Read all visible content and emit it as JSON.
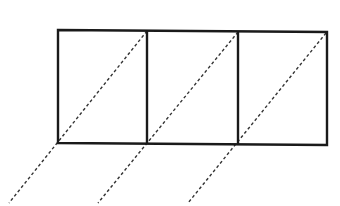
{
  "diagram": {
    "stroke_color": "#1a1a1a",
    "dash_color": "#333333",
    "outer_rect": {
      "x1": 58,
      "y1": 30,
      "x2": 327,
      "y2": 144
    },
    "dividers": [
      147,
      238
    ],
    "diagonals": [
      {
        "x1": 147,
        "y1": 31,
        "x2": 9,
        "y2": 203
      },
      {
        "x1": 238,
        "y1": 32,
        "x2": 98,
        "y2": 203
      },
      {
        "x1": 326,
        "y1": 33,
        "x2": 188,
        "y2": 203
      }
    ]
  }
}
